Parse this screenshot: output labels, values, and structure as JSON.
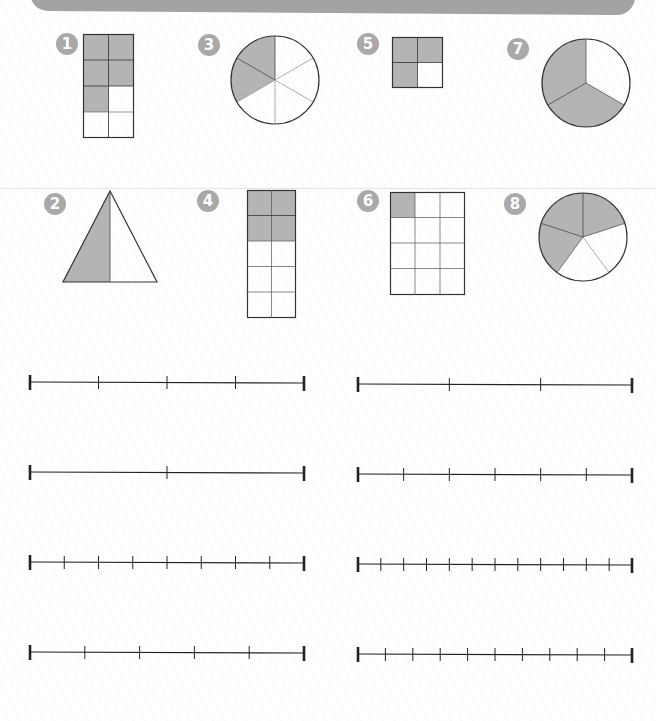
{
  "header": {
    "bar_color": "#a3a3a3"
  },
  "colors": {
    "shade": "#b4b4b4",
    "stroke": "#333333",
    "badge": "#a9a9a9"
  },
  "problems": [
    {
      "number": "1",
      "shape": "rectangle-grid",
      "rows": 4,
      "cols": 2,
      "shaded_cells": 5,
      "total_cells": 8
    },
    {
      "number": "2",
      "shape": "triangle",
      "parts": 2,
      "shaded_parts": 1
    },
    {
      "number": "3",
      "shape": "circle",
      "parts": 6,
      "shaded_parts": 2
    },
    {
      "number": "4",
      "shape": "rectangle-grid",
      "rows": 5,
      "cols": 2,
      "shaded_cells": 4,
      "total_cells": 10
    },
    {
      "number": "5",
      "shape": "square-grid",
      "rows": 2,
      "cols": 2,
      "shaded_cells": 3,
      "total_cells": 4
    },
    {
      "number": "6",
      "shape": "rectangle-grid",
      "rows": 4,
      "cols": 3,
      "shaded_cells": 1,
      "total_cells": 12
    },
    {
      "number": "7",
      "shape": "circle",
      "parts": 3,
      "shaded_parts": 2
    },
    {
      "number": "8",
      "shape": "circle",
      "parts": 5,
      "shaded_parts": 3
    }
  ],
  "number_lines": [
    {
      "position": "row1-left",
      "divisions": 4
    },
    {
      "position": "row1-right",
      "divisions": 3
    },
    {
      "position": "row2-left",
      "divisions": 2
    },
    {
      "position": "row2-right",
      "divisions": 6
    },
    {
      "position": "row3-left",
      "divisions": 8
    },
    {
      "position": "row3-right",
      "divisions": 12
    },
    {
      "position": "row4-left",
      "divisions": 5
    },
    {
      "position": "row4-right",
      "divisions": 10
    }
  ]
}
